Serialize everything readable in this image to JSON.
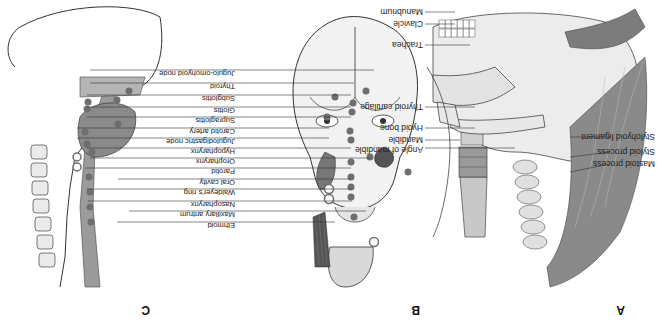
{
  "figure": {
    "orientation": "rotated 180 degrees",
    "panels": [
      {
        "id": "A",
        "label": "A",
        "labels": [
          "Manubrium",
          "Clavicle",
          "Trachea",
          "Thyroid cartilage",
          "Hyoid bone",
          "Mandible",
          "Angle of mandible",
          "Stylohyoid ligament",
          "Styloid process",
          "Mastoid process"
        ]
      },
      {
        "id": "B",
        "label": "B"
      },
      {
        "id": "C",
        "label": "C"
      }
    ],
    "shared_labels": [
      "Jugulo-omohyoid node",
      "Thyroid",
      "Subglottis",
      "Glottis",
      "Supraglottis",
      "Carotid artery",
      "Jugulodigastric node",
      "Hypopharynx",
      "Oropharynx",
      "Parotid",
      "Oral cavity",
      "Waldeyer's ring",
      "Nasopharynx",
      "Maxillary antrum",
      "Ethmoid"
    ],
    "colors": {
      "line": "#333333",
      "fill_dark": "#777777",
      "fill_mid": "#a9a9a9",
      "fill_light": "#d6d6d6",
      "marker": "#6e6e6e"
    }
  }
}
